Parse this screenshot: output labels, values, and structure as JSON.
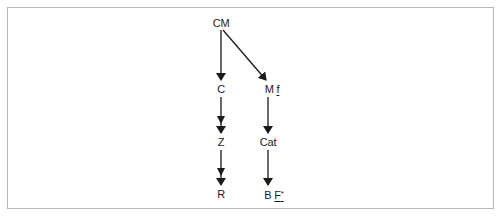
{
  "diagram": {
    "type": "category-functor-diagram",
    "nodes": [
      {
        "id": "CM",
        "label": "CM",
        "x": 221,
        "y": 17
      },
      {
        "id": "C",
        "label": "C",
        "x": 221,
        "y": 83
      },
      {
        "id": "Mf",
        "label": "M",
        "label_underlined": "f",
        "x": 268,
        "y": 83
      },
      {
        "id": "Z",
        "label": "Z",
        "x": 221,
        "y": 136
      },
      {
        "id": "Cat",
        "label": "Cat",
        "x": 268,
        "y": 136
      },
      {
        "id": "R",
        "label": "R",
        "x": 221,
        "y": 188
      },
      {
        "id": "BF",
        "label": "B",
        "label_underlined": "F",
        "label_superscript": "*",
        "x": 268,
        "y": 188
      }
    ],
    "edges": [
      {
        "from": "CM",
        "to": "C",
        "style": "single-arrow"
      },
      {
        "from": "CM",
        "to": "Mf",
        "style": "single-arrow"
      },
      {
        "from": "C",
        "to": "Z",
        "style": "double-head-arrow"
      },
      {
        "from": "Z",
        "to": "R",
        "style": "double-head-arrow"
      },
      {
        "from": "Mf",
        "to": "Cat",
        "style": "single-arrow"
      },
      {
        "from": "Cat",
        "to": "BF",
        "style": "single-arrow"
      }
    ],
    "colors": {
      "ink": "#1a1a1a",
      "frame": "#b8b8b8",
      "background": "#ffffff"
    }
  }
}
